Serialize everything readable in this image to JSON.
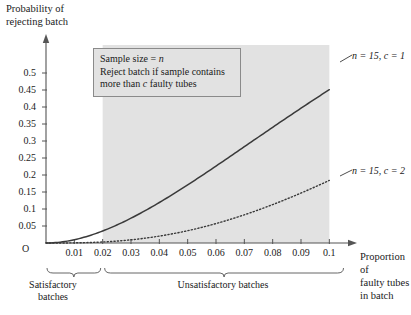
{
  "chart_data": {
    "type": "line",
    "title": "",
    "xlabel": "Proportion of faulty tubes in batch",
    "ylabel": "Probability of rejecting batch",
    "xlim": [
      0,
      0.108
    ],
    "ylim": [
      0,
      0.55
    ],
    "grid": false,
    "legend_position": "right-of-curve-end",
    "x_ticks": [
      "0.01",
      "0.02",
      "0.03",
      "0.04",
      "0.05",
      "0.06",
      "0.07",
      "0.08",
      "0.09",
      "0.1"
    ],
    "x_tick_values": [
      0.01,
      0.02,
      0.03,
      0.04,
      0.05,
      0.06,
      0.07,
      0.08,
      0.09,
      0.1
    ],
    "y_ticks": [
      "0.05",
      "0.1",
      "0.15",
      "0.2",
      "0.25",
      "0.3",
      "0.35",
      "0.4",
      "0.45",
      "0.5"
    ],
    "y_tick_values": [
      0.05,
      0.1,
      0.15,
      0.2,
      0.25,
      0.3,
      0.35,
      0.4,
      0.45,
      0.5
    ],
    "origin_label": "O",
    "x": [
      0,
      0.005,
      0.01,
      0.015,
      0.02,
      0.025,
      0.03,
      0.035,
      0.04,
      0.045,
      0.05,
      0.055,
      0.06,
      0.065,
      0.07,
      0.075,
      0.08,
      0.085,
      0.09,
      0.095,
      0.1
    ],
    "series": [
      {
        "name": "n = 15, c = 1",
        "style": "solid",
        "color": "#3a3a3a",
        "values": [
          0,
          0.0026,
          0.0096,
          0.0202,
          0.0353,
          0.0528,
          0.0729,
          0.0954,
          0.12,
          0.1465,
          0.1748,
          0.2045,
          0.2356,
          0.2677,
          0.3006,
          0.3343,
          0.3685,
          0.403,
          0.4376,
          0.4723,
          0.4993
        ]
      },
      {
        "name": "n = 15, c = 2",
        "style": "dotted",
        "color": "#3a3a3a",
        "values": [
          0,
          0.0002,
          0.0012,
          0.0037,
          0.0082,
          0.0149,
          0.0242,
          0.036,
          0.0504,
          0.0673,
          0.0864,
          0.1077,
          0.1309,
          0.1559,
          0.1823,
          0.21,
          0.2386,
          0.268,
          0.2978,
          0.328,
          0.1645
        ]
      }
    ],
    "shaded_region": {
      "label": "unsatisfactory-zone",
      "x_from": 0.02,
      "x_to": 0.1,
      "color": "#e2e2e2"
    },
    "annotations": {
      "textbox": {
        "line1_prefix": "Sample size = ",
        "line1_italic": "n",
        "line2": "Reject batch if sample contains",
        "line3_prefix": "more than ",
        "line3_italic": "c",
        "line3_suffix": " faulty tubes"
      },
      "brackets": [
        {
          "label": "Satisfactory\nbatches",
          "x_from": 0,
          "x_to": 0.02
        },
        {
          "label": "Unsatisfactory batches",
          "x_from": 0.02,
          "x_to": 0.105
        }
      ]
    },
    "curve_labels": [
      {
        "text": "n = 15, c = 1",
        "at_x": 0.1,
        "at_y": 0.45
      },
      {
        "text": "n = 15, c = 2",
        "at_x": 0.1,
        "at_y": 0.165
      }
    ]
  },
  "axis_titles": {
    "y": "Probability of\nrejecting batch",
    "x": "Proportion of\nfaulty tubes\nin batch"
  }
}
